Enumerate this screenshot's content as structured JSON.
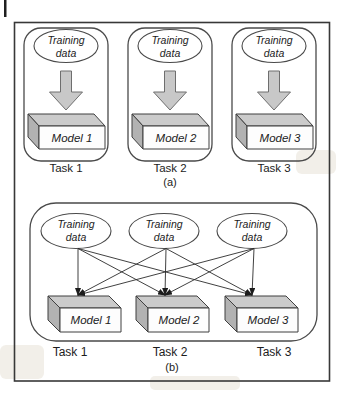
{
  "figure": {
    "ellipse_label": {
      "line1": "Training",
      "line2": "data"
    },
    "part_a": {
      "label": "(a)",
      "units": [
        {
          "model": "Model 1",
          "task": "Task 1"
        },
        {
          "model": "Model 2",
          "task": "Task 2"
        },
        {
          "model": "Model 3",
          "task": "Task 3"
        }
      ]
    },
    "part_b": {
      "label": "(b)",
      "units": [
        {
          "model": "Model 1",
          "task": "Task 1"
        },
        {
          "model": "Model 2",
          "task": "Task 2"
        },
        {
          "model": "Model 3",
          "task": "Task 3"
        }
      ]
    },
    "colors": {
      "box_top": "#cbcbcb",
      "box_side": "#b2b2b2",
      "box_front": "#fdfdfd",
      "arrow_fill": "#c8c8c8"
    }
  }
}
